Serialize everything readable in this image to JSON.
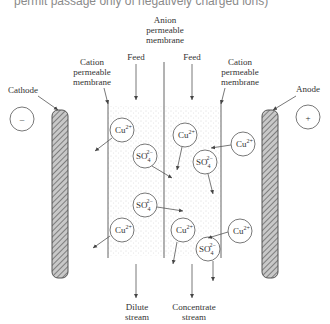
{
  "caption": "permit passage only of negatively charged ions)",
  "labels": {
    "anion_membrane": [
      "Anion",
      "permeable",
      "membrane"
    ],
    "cation_membrane_left": [
      "Cation",
      "permeable",
      "membrane"
    ],
    "cation_membrane_right": [
      "Cation",
      "permeable",
      "membrane"
    ],
    "feed_left": "Feed",
    "feed_right": "Feed",
    "cathode": "Cathode",
    "anode": "Anode",
    "cathode_sign": "–",
    "anode_sign": "+",
    "dilute": [
      "Dilute",
      "stream"
    ],
    "concentrate": [
      "Concentrate",
      "stream"
    ]
  },
  "ions": {
    "cu": "Cu",
    "cu_charge": "2+",
    "so4": "SO",
    "so4_sub": "4",
    "so4_charge": "2−"
  },
  "colors": {
    "line": "#555555",
    "electrode_fill": "#9a9a9a",
    "stipple": "#bdbdbd"
  }
}
